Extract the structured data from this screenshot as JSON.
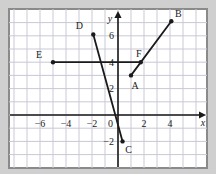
{
  "figure": {
    "background_color": "#cfcfcf",
    "plot_background_color": "#ffffff",
    "frame_color": "#8a8a8a",
    "grid_color": "#c9c9d6",
    "axis_color": "#1a1a1a",
    "axis_labels": {
      "x": "x",
      "y": "y"
    }
  },
  "chart_data": {
    "type": "scatter",
    "title": "",
    "xlabel": "x",
    "ylabel": "y",
    "grid": true,
    "legend": "none",
    "xlim": [
      -8.3,
      6.6
    ],
    "ylim": [
      -3.2,
      8.2
    ],
    "xticks": [
      -6,
      -4,
      -2,
      0,
      2,
      4
    ],
    "xtick_labels": [
      "−6",
      "−4",
      "−2",
      "0",
      "2",
      "4"
    ],
    "yticks": [
      -2,
      2,
      4,
      6
    ],
    "ytick_labels": [
      "−2",
      "2",
      "4",
      "6"
    ],
    "origin_label": "0",
    "points": [
      {
        "label": "A",
        "x": 1.0,
        "y": 3.0,
        "label_dx": 4,
        "label_dy": 14
      },
      {
        "label": "B",
        "x": 4.1,
        "y": 7.1,
        "label_dx": 7,
        "label_dy": -4
      },
      {
        "label": "C",
        "x": 0.35,
        "y": -2.0,
        "label_dx": 6,
        "label_dy": 12
      },
      {
        "label": "D",
        "x": -1.9,
        "y": 6.1,
        "label_dx": -14,
        "label_dy": -5
      },
      {
        "label": "E",
        "x": -5.0,
        "y": 4.0,
        "label_dx": -14,
        "label_dy": -4
      },
      {
        "label": "F",
        "x": 1.75,
        "y": 4.0,
        "label_dx": -2,
        "label_dy": -5
      }
    ],
    "segments": [
      {
        "name": "segment-AB",
        "from": "A",
        "to": "B"
      },
      {
        "name": "segment-CD",
        "from": "C",
        "to": "D"
      },
      {
        "name": "segment-EF",
        "from": "E",
        "to": "F"
      }
    ]
  }
}
